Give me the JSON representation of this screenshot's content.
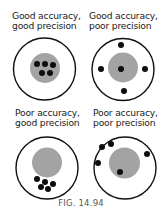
{
  "figure": {
    "caption": "FIG. 14.94",
    "colors": {
      "ring": "#111111",
      "bullseye": "#a3a3a3",
      "dot": "#0d0d0d",
      "background": "#ffffff"
    },
    "panels": [
      {
        "id": "good-acc-good-prec",
        "label_line1": "Good accuracy,",
        "label_line2": "good precision",
        "label_pos": [
          12,
          11
        ],
        "target": {
          "cx": 44.5,
          "cy": 69,
          "r": 31
        },
        "bullseye": {
          "cx": 45,
          "cy": 68,
          "r": 15
        },
        "dots": [
          [
            37,
            64
          ],
          [
            45,
            64
          ],
          [
            53,
            65
          ],
          [
            42,
            73
          ],
          [
            50,
            73
          ]
        ]
      },
      {
        "id": "good-acc-poor-prec",
        "label_line1": "Good accuracy,",
        "label_line2": "poor precision",
        "label_pos": [
          89,
          11
        ],
        "target": {
          "cx": 123,
          "cy": 69.5,
          "r": 31
        },
        "bullseye": {
          "cx": 123,
          "cy": 67.5,
          "r": 15
        },
        "dots": [
          [
            121,
            45
          ],
          [
            101,
            69
          ],
          [
            121,
            69
          ],
          [
            145,
            69
          ],
          [
            124,
            91
          ]
        ]
      },
      {
        "id": "poor-acc-good-prec",
        "label_line1": "Poor accuracy,",
        "label_line2": "good precision",
        "label_pos": [
          15,
          108
        ],
        "target": {
          "cx": 47,
          "cy": 168,
          "r": 31
        },
        "bullseye": {
          "cx": 47,
          "cy": 162.5,
          "r": 15
        },
        "dots": [
          [
            37,
            179
          ],
          [
            45,
            182
          ],
          [
            53,
            184
          ],
          [
            41,
            187
          ],
          [
            48,
            189
          ]
        ]
      },
      {
        "id": "poor-acc-poor-prec",
        "label_line1": "Poor accuracy,",
        "label_line2": "poor precision",
        "label_pos": [
          93,
          108
        ],
        "target": {
          "cx": 125,
          "cy": 168,
          "r": 31
        },
        "bullseye": {
          "cx": 124.5,
          "cy": 163,
          "r": 15.5
        },
        "dots": [
          [
            102,
            147
          ],
          [
            111,
            144
          ],
          [
            98,
            163
          ],
          [
            147,
            154
          ],
          [
            120,
            172
          ]
        ]
      }
    ]
  }
}
